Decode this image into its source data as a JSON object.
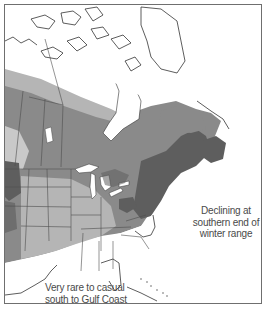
{
  "map": {
    "type": "species-range-map",
    "region": "North America",
    "colors": {
      "background": "#ffffff",
      "frame": "#6f6f6f",
      "coastline": "#333333",
      "border": "#4d4d4d",
      "range_dark": "#5e5e5e",
      "range_medium": "#8a8a8a",
      "range_light": "#b5b5b5",
      "range_lightest": "#c9c9c9",
      "water": "#ffffff"
    },
    "legend_shades": [
      {
        "name": "darkest",
        "color": "#5e5e5e"
      },
      {
        "name": "medium",
        "color": "#8a8a8a"
      },
      {
        "name": "light",
        "color": "#b5b5b5"
      }
    ],
    "annotations": [
      {
        "id": "decline",
        "lines": [
          "Declining at",
          "southern end of",
          "winter range"
        ]
      },
      {
        "id": "rare",
        "lines": [
          "Very rare to casual",
          "south to Gulf Coast"
        ]
      }
    ]
  }
}
